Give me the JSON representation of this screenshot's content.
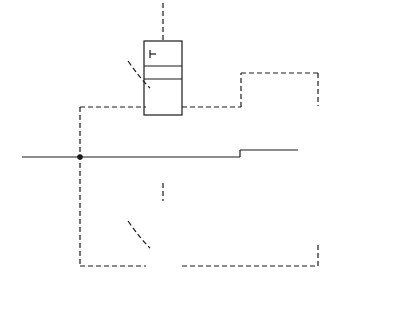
{
  "diagram": {
    "type": "pneumatic-logic-circuit",
    "caption": "(a)",
    "input_label": "INPUT",
    "valves": [
      {
        "id": "A",
        "label": "A",
        "kind": "3/2 valve, spring return, pilot/lever"
      },
      {
        "id": "B",
        "label": "B",
        "kind": "3/2 valve, spring return, pilot/lever"
      },
      {
        "id": "main",
        "label": "",
        "kind": "5/2 pilot-operated valve"
      }
    ],
    "outputs": [
      {
        "id": "C",
        "prefix": "OUTPUT",
        "letter": "C"
      },
      {
        "id": "D",
        "prefix": "OUTPUT",
        "letter": "D"
      }
    ],
    "colors": {
      "line": "#1a1a1a",
      "background": "#ffffff"
    }
  }
}
